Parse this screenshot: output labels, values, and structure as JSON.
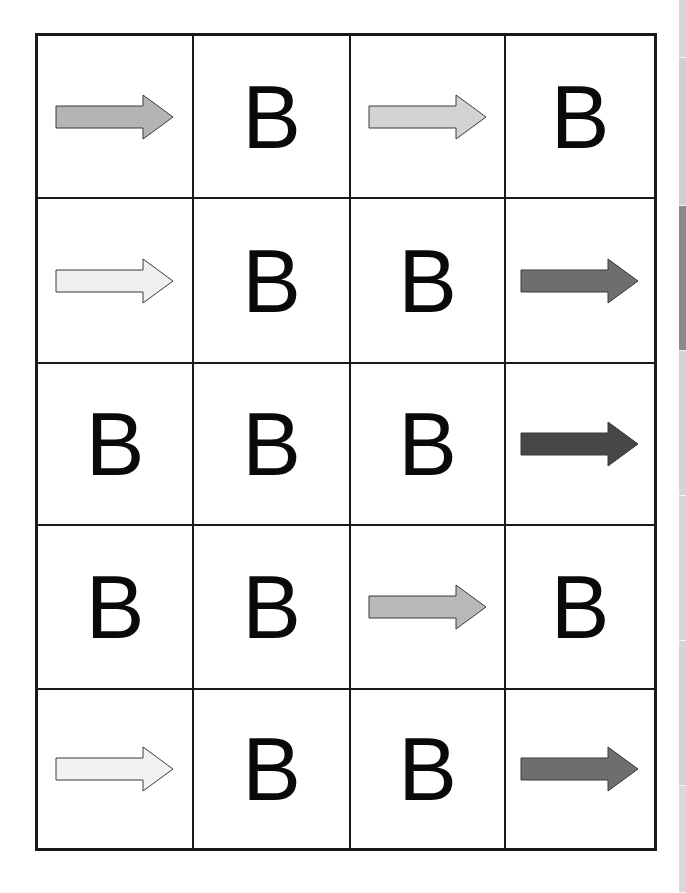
{
  "grid": {
    "rows": 5,
    "cols": 4,
    "cells": [
      [
        {
          "type": "arrow",
          "direction": "right",
          "fill": "#b4b4b4"
        },
        {
          "type": "letter",
          "text": "B"
        },
        {
          "type": "arrow",
          "direction": "right",
          "fill": "#d3d3d3"
        },
        {
          "type": "letter",
          "text": "B"
        }
      ],
      [
        {
          "type": "arrow",
          "direction": "right",
          "fill": "#efefef"
        },
        {
          "type": "letter",
          "text": "B"
        },
        {
          "type": "letter",
          "text": "B"
        },
        {
          "type": "arrow",
          "direction": "right",
          "fill": "#6e6e6e"
        }
      ],
      [
        {
          "type": "letter",
          "text": "B"
        },
        {
          "type": "letter",
          "text": "B"
        },
        {
          "type": "letter",
          "text": "B"
        },
        {
          "type": "arrow",
          "direction": "right",
          "fill": "#474747"
        }
      ],
      [
        {
          "type": "letter",
          "text": "B"
        },
        {
          "type": "letter",
          "text": "B"
        },
        {
          "type": "arrow",
          "direction": "right",
          "fill": "#b9b9b9"
        },
        {
          "type": "letter",
          "text": "B"
        }
      ],
      [
        {
          "type": "arrow",
          "direction": "right",
          "fill": "#f2f2f2"
        },
        {
          "type": "letter",
          "text": "B"
        },
        {
          "type": "letter",
          "text": "B"
        },
        {
          "type": "arrow",
          "direction": "right",
          "fill": "#6e6e6e"
        }
      ]
    ]
  },
  "edge_strip": {
    "segments": [
      {
        "height": 58,
        "color": "#d6d6d6"
      },
      {
        "height": 148,
        "color": "#d0d0d0"
      },
      {
        "height": 145,
        "color": "#8a8a8a"
      },
      {
        "height": 145,
        "color": "#d4d4d4"
      },
      {
        "height": 145,
        "color": "#d6d6d6"
      },
      {
        "height": 145,
        "color": "#d4d4d4"
      },
      {
        "height": 107,
        "color": "#d8d8d8"
      }
    ]
  }
}
